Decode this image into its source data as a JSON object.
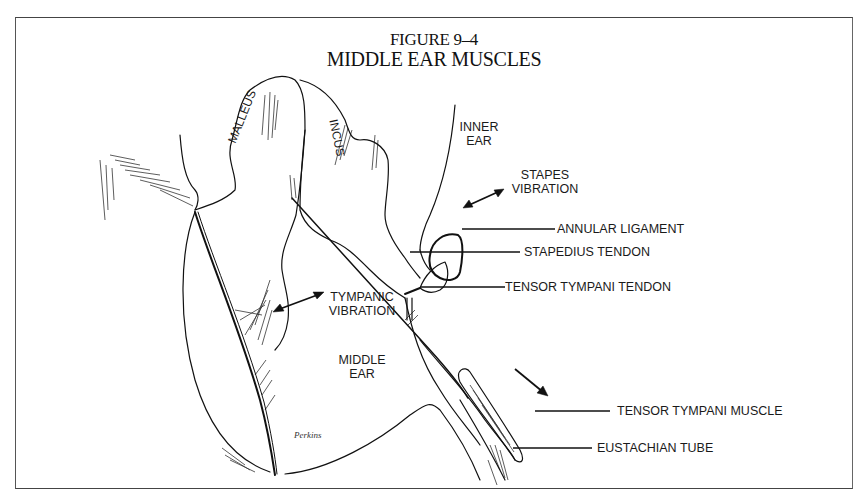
{
  "figure": {
    "number": "FIGURE 9–4",
    "title": "MIDDLE EAR MUSCLES"
  },
  "structures": {
    "malleus": "MALLEUS",
    "incus": "INCUS",
    "inner_ear_line1": "INNER",
    "inner_ear_line2": "EAR",
    "middle_ear_line1": "MIDDLE",
    "middle_ear_line2": "EAR"
  },
  "annotations": {
    "stapes_vibration_line1": "STAPES",
    "stapes_vibration_line2": "VIBRATION",
    "tympanic_vibration_line1": "TYMPANIC",
    "tympanic_vibration_line2": "VIBRATION"
  },
  "callouts": [
    {
      "label": "ANNULAR LIGAMENT"
    },
    {
      "label": "STAPEDIUS TENDON"
    },
    {
      "label": "TENSOR TYMPANI TENDON"
    },
    {
      "label": "TENSOR TYMPANI MUSCLE"
    },
    {
      "label": "EUSTACHIAN TUBE"
    }
  ],
  "signature": "Perkins"
}
